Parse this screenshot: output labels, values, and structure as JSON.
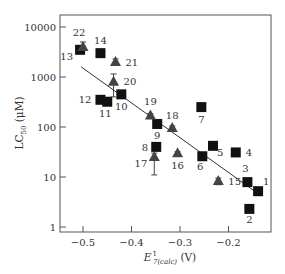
{
  "chart_data": {
    "type": "scatter",
    "title": "",
    "xlabel": "E¹₇(calc) (V)",
    "xlabel_main": "E",
    "xlabel_sup": "1",
    "xlabel_sub": "7(calc)",
    "xlabel_unit": "(V)",
    "ylabel": "LC50 (μM)",
    "ylabel_main": "LC",
    "ylabel_sub": "50",
    "ylabel_unit": "(μM)",
    "yscale": "log",
    "xlim": [
      -0.545,
      -0.11
    ],
    "ylim": [
      0.9,
      14000
    ],
    "x_ticks": [
      -0.5,
      -0.4,
      -0.3,
      -0.2
    ],
    "x_tick_labels": [
      "−0.5",
      "−0.4",
      "−0.3",
      "−0.2"
    ],
    "y_ticks": [
      1,
      10,
      100,
      1000,
      10000
    ],
    "y_tick_labels": [
      "1",
      "10",
      "100",
      "1000",
      "10000"
    ],
    "grid": false,
    "legend": null,
    "series": [
      {
        "name": "squares",
        "marker": "square",
        "color": "#111111",
        "points": [
          {
            "label": "1",
            "x": -0.139,
            "y": 5.2
          },
          {
            "label": "2",
            "x": -0.157,
            "y": 2.3
          },
          {
            "label": "3",
            "x": -0.161,
            "y": 7.9
          },
          {
            "label": "4",
            "x": -0.185,
            "y": 31
          },
          {
            "label": "5",
            "x": -0.232,
            "y": 42
          },
          {
            "label": "6",
            "x": -0.254,
            "y": 26
          },
          {
            "label": "7",
            "x": -0.256,
            "y": 250
          },
          {
            "label": "8",
            "x": -0.349,
            "y": 40
          },
          {
            "label": "9",
            "x": -0.347,
            "y": 115
          },
          {
            "label": "10",
            "x": -0.421,
            "y": 450
          },
          {
            "label": "11",
            "x": -0.45,
            "y": 320
          },
          {
            "label": "12",
            "x": -0.464,
            "y": 350
          },
          {
            "label": "13",
            "x": -0.506,
            "y": 3500
          },
          {
            "label": "14",
            "x": -0.464,
            "y": 3000
          }
        ]
      },
      {
        "name": "triangles",
        "marker": "triangle",
        "color": "#444444",
        "error_bars": true,
        "points": [
          {
            "label": "15",
            "x": -0.221,
            "y": 8.3,
            "err_low": 7.0,
            "err_high": 9.5
          },
          {
            "label": "16",
            "x": -0.305,
            "y": 30,
            "err_low": 28,
            "err_high": 32
          },
          {
            "label": "17",
            "x": -0.353,
            "y": 25,
            "err_low": 11,
            "err_high": 30
          },
          {
            "label": "18",
            "x": -0.316,
            "y": 95,
            "err_low": 85,
            "err_high": 105
          },
          {
            "label": "19",
            "x": -0.361,
            "y": 170,
            "err_low": 155,
            "err_high": 185
          },
          {
            "label": "20",
            "x": -0.437,
            "y": 800,
            "err_low": 400,
            "err_high": 1150
          },
          {
            "label": "21",
            "x": -0.433,
            "y": 2000,
            "err_low": 1800,
            "err_high": 2300
          },
          {
            "label": "22",
            "x": -0.5,
            "y": 4000,
            "err_low": 3600,
            "err_high": 5000
          }
        ]
      }
    ],
    "fit_line": {
      "type": "linear-log",
      "x": [
        -0.504,
        -0.137
      ],
      "y": [
        1600,
        4.5
      ]
    }
  }
}
